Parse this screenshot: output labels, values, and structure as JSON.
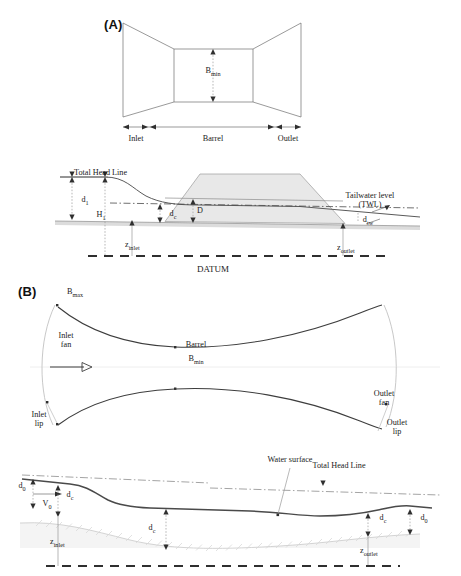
{
  "figure": {
    "type": "engineering-diagram",
    "background_color": "#ffffff",
    "line_color": "#3b3b3b",
    "fill_embankment": "#e9e9e9",
    "fill_bed": "#dedede"
  },
  "panels": {
    "a": {
      "letter": "(A)",
      "plan": {
        "dimension_label": "B",
        "dimension_sub": "min",
        "stations": [
          "Inlet",
          "Barrel",
          "Outlet"
        ]
      },
      "profile": {
        "total_head_line": "Total Head Line",
        "tailwater_line1": "Tailwater level",
        "tailwater_line2": "(TWL)",
        "datum": "DATUM",
        "depth_d1": "d",
        "depth_d1_sub": "1",
        "head_h1": "H",
        "head_h1_sub": "1",
        "critical_depth": "d",
        "critical_depth_sub": "c",
        "barrel_height": "D",
        "tailwater_depth": "d",
        "tailwater_depth_sub": "tw",
        "z_inlet": "z",
        "z_inlet_sub": "inlet",
        "z_outlet": "z",
        "z_outlet_sub": "outlet"
      }
    },
    "b": {
      "letter": "(B)",
      "plan": {
        "b_max": "B",
        "b_max_sub": "max",
        "b_min": "B",
        "b_min_sub": "min",
        "barrel": "Barrel",
        "inlet_fan_line1": "Inlet",
        "inlet_fan_line2": "fan",
        "outlet_fan_line1": "Outlet",
        "outlet_fan_line2": "fan",
        "inlet_lip_line1": "Inlet",
        "inlet_lip_line2": "lip",
        "outlet_lip_line1": "Outlet",
        "outlet_lip_line2": "lip",
        "flow_arrow": "flow-direction-arrow"
      },
      "profile": {
        "water_surface": "Water surface",
        "total_head_line": "Total Head Line",
        "d_o_left": "d",
        "d_o_left_sub": "0",
        "v_o": "V",
        "v_o_sub": "0",
        "d_c_left": "d",
        "d_c_left_sub": "c",
        "d_c_mid": "d",
        "d_c_mid_sub": "c",
        "d_c_right": "d",
        "d_c_right_sub": "c",
        "d_o_right": "d",
        "d_o_right_sub": "0",
        "z_inlet": "z",
        "z_inlet_sub": "inlet",
        "z_outlet": "z",
        "z_outlet_sub": "outlet"
      }
    }
  }
}
